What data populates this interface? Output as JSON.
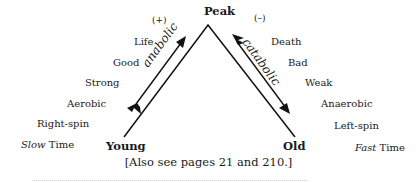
{
  "diagram": {
    "apex": {
      "label": "Peak"
    },
    "start": {
      "label": "Young"
    },
    "end": {
      "label": "Old"
    },
    "left_sign": "(+)",
    "right_sign": "(–)",
    "arrows": {
      "up": {
        "label": "anabolic",
        "direction": "up-right"
      },
      "down": {
        "label": "catabolic",
        "direction": "down-right"
      }
    },
    "left_terms": [
      "Life",
      "Good",
      "Strong",
      "Aerobic",
      "Right-spin"
    ],
    "left_time": {
      "emph": "Slow",
      "rest": " Time"
    },
    "right_terms": [
      "Death",
      "Bad",
      "Weak",
      "Anaerobic",
      "Left-spin"
    ],
    "right_time": {
      "emph": "Fast",
      "rest": " Time"
    }
  },
  "caption": "[Also see pages 21 and 210.]"
}
